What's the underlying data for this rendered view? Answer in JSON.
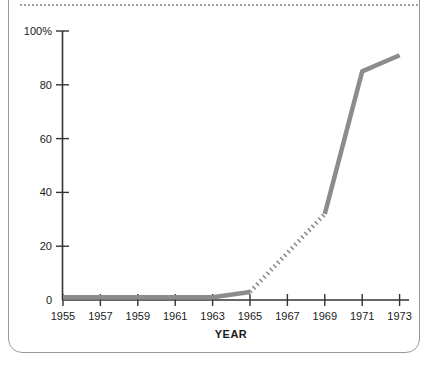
{
  "chart_data": {
    "type": "line",
    "title": "",
    "subtitle": "",
    "xlabel": "YEAR",
    "ylabel": "",
    "x": [
      1955,
      1957,
      1959,
      1961,
      1963,
      1965,
      1967,
      1969,
      1971,
      1973
    ],
    "xlim": [
      1955,
      1973
    ],
    "ylim": [
      0,
      100
    ],
    "yticks": [
      0,
      20,
      40,
      60,
      80,
      100
    ],
    "ytick_labels": [
      "0",
      "20",
      "40",
      "60",
      "80",
      "100%"
    ],
    "xtick_labels": [
      "1955",
      "1957",
      "1959",
      "1961",
      "1963",
      "1965",
      "1967",
      "1969",
      "1971",
      "1973"
    ],
    "grid": false,
    "legend": "none",
    "series": [
      {
        "name": "observed-early",
        "style": "solid",
        "color": "#8c8c8c",
        "points": [
          {
            "x": 1955,
            "y": 1
          },
          {
            "x": 1957,
            "y": 1
          },
          {
            "x": 1959,
            "y": 1
          },
          {
            "x": 1961,
            "y": 1
          },
          {
            "x": 1963,
            "y": 1
          },
          {
            "x": 1965,
            "y": 3
          }
        ]
      },
      {
        "name": "interpolated",
        "style": "dotted",
        "color": "#8c8c8c",
        "points": [
          {
            "x": 1965,
            "y": 3
          },
          {
            "x": 1969,
            "y": 32
          }
        ]
      },
      {
        "name": "observed-late",
        "style": "solid",
        "color": "#8c8c8c",
        "points": [
          {
            "x": 1969,
            "y": 32
          },
          {
            "x": 1971,
            "y": 85
          },
          {
            "x": 1973,
            "y": 91
          }
        ]
      }
    ],
    "values_combined": [
      1,
      1,
      1,
      1,
      1,
      3,
      17,
      32,
      85,
      91
    ],
    "axis_color": "#333333",
    "line_color": "#8c8c8c",
    "frame_color": "#9a9a9a"
  },
  "figure": {
    "top_rule_style": "dotted"
  }
}
